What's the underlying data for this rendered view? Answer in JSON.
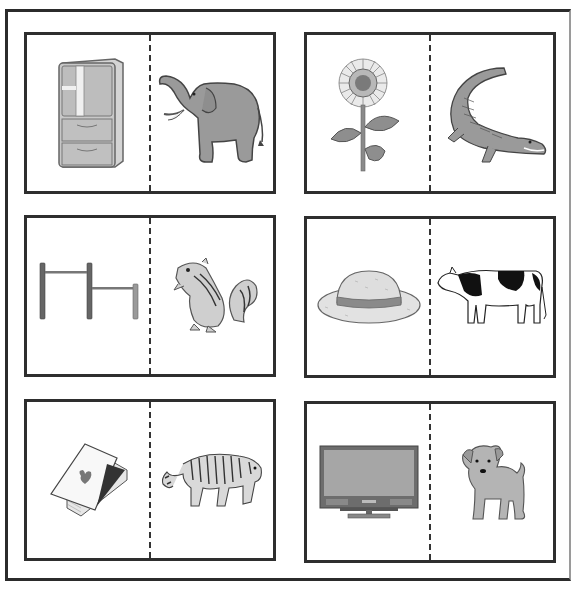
{
  "worksheet": {
    "cards": [
      {
        "left": {
          "item": "refrigerator",
          "icon": "refrigerator-icon"
        },
        "right": {
          "item": "elephant",
          "icon": "elephant-icon"
        }
      },
      {
        "left": {
          "item": "sunflower",
          "icon": "sunflower-icon"
        },
        "right": {
          "item": "crocodile",
          "icon": "crocodile-icon"
        }
      },
      {
        "left": {
          "item": "horizontal bars",
          "icon": "horizontal-bars-icon"
        },
        "right": {
          "item": "chipmunk",
          "icon": "chipmunk-icon"
        }
      },
      {
        "left": {
          "item": "straw hat",
          "icon": "straw-hat-icon"
        },
        "right": {
          "item": "cow",
          "icon": "cow-icon"
        }
      },
      {
        "left": {
          "item": "playing cards",
          "icon": "playing-cards-icon"
        },
        "right": {
          "item": "tiger",
          "icon": "tiger-icon"
        }
      },
      {
        "left": {
          "item": "television",
          "icon": "television-icon"
        },
        "right": {
          "item": "puppy",
          "icon": "puppy-icon"
        }
      }
    ]
  },
  "colors": {
    "border": "#2e2e2e",
    "fill_gray": "#9b9b9b",
    "fill_light": "#d8d8d8",
    "background": "#ffffff"
  }
}
